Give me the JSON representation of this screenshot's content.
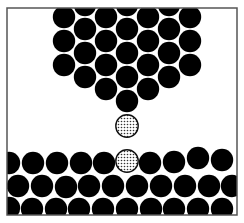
{
  "diagram": {
    "kind": "granular-packing-illustration",
    "canvas": {
      "width": 244,
      "height": 223,
      "background": "#ffffff"
    },
    "frame": {
      "x": 7,
      "y": 8,
      "width": 230,
      "height": 207,
      "stroke": "#555555",
      "stroke_width": 1.5
    },
    "colors": {
      "solid": "#000000",
      "stipple_bg": "#ffffff",
      "stipple_dot": "#333333",
      "stipple_ring": "#111111"
    },
    "radius": 11.2,
    "top_cluster": [
      [
        64,
        17
      ],
      [
        64,
        41
      ],
      [
        64,
        65
      ],
      [
        85,
        5
      ],
      [
        85,
        29
      ],
      [
        85,
        53
      ],
      [
        85,
        77
      ],
      [
        106,
        17
      ],
      [
        106,
        41
      ],
      [
        106,
        65
      ],
      [
        106,
        89
      ],
      [
        127,
        5
      ],
      [
        127,
        29
      ],
      [
        127,
        53
      ],
      [
        127,
        77
      ],
      [
        127,
        101
      ],
      [
        148,
        17
      ],
      [
        148,
        41
      ],
      [
        148,
        65
      ],
      [
        148,
        89
      ],
      [
        169,
        5
      ],
      [
        169,
        29
      ],
      [
        169,
        53
      ],
      [
        169,
        77
      ],
      [
        190,
        17
      ],
      [
        190,
        41
      ],
      [
        190,
        65
      ]
    ],
    "stippled": [
      [
        127,
        126
      ],
      [
        127,
        161
      ]
    ],
    "bottom_bed": [
      [
        9,
        163
      ],
      [
        33,
        163
      ],
      [
        57,
        163
      ],
      [
        81,
        163
      ],
      [
        104,
        163
      ],
      [
        150,
        163
      ],
      [
        174,
        162
      ],
      [
        198,
        158
      ],
      [
        222,
        160
      ],
      [
        18,
        186
      ],
      [
        42,
        186
      ],
      [
        66,
        187
      ],
      [
        89,
        186
      ],
      [
        113,
        186
      ],
      [
        137,
        186
      ],
      [
        161,
        186
      ],
      [
        185,
        186
      ],
      [
        209,
        186
      ],
      [
        232,
        186
      ],
      [
        9,
        208
      ],
      [
        32,
        209
      ],
      [
        56,
        209
      ],
      [
        79,
        209
      ],
      [
        103,
        209
      ],
      [
        127,
        209
      ],
      [
        151,
        209
      ],
      [
        174,
        209
      ],
      [
        198,
        209
      ],
      [
        222,
        209
      ]
    ]
  }
}
